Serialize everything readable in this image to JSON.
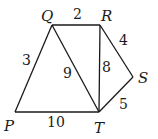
{
  "diagram": {
    "type": "weighted-graph",
    "vertices": [
      {
        "id": "P",
        "label": "P",
        "x": 15,
        "y": 112,
        "lx": 4,
        "ly": 131
      },
      {
        "id": "Q",
        "label": "Q",
        "x": 52,
        "y": 25,
        "lx": 41,
        "ly": 21
      },
      {
        "id": "R",
        "label": "R",
        "x": 100,
        "y": 25,
        "lx": 101,
        "ly": 21
      },
      {
        "id": "S",
        "label": "S",
        "x": 133,
        "y": 77,
        "lx": 138,
        "ly": 83
      },
      {
        "id": "T",
        "label": "T",
        "x": 99,
        "y": 112,
        "lx": 94,
        "ly": 133
      }
    ],
    "edges": [
      {
        "from": "P",
        "to": "Q",
        "weight": "3",
        "wx": 22,
        "wy": 65
      },
      {
        "from": "Q",
        "to": "R",
        "weight": "2",
        "wx": 73,
        "wy": 19
      },
      {
        "from": "Q",
        "to": "T",
        "weight": "9",
        "wx": 63,
        "wy": 78
      },
      {
        "from": "R",
        "to": "T",
        "weight": "8",
        "wx": 102,
        "wy": 72
      },
      {
        "from": "R",
        "to": "S",
        "weight": "4",
        "wx": 119,
        "wy": 45
      },
      {
        "from": "S",
        "to": "T",
        "weight": "5",
        "wx": 119,
        "wy": 109
      },
      {
        "from": "P",
        "to": "T",
        "weight": "10",
        "wx": 47,
        "wy": 127
      }
    ]
  }
}
